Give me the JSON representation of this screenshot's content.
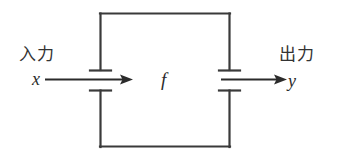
{
  "figure": {
    "kind": "block-diagram",
    "title_text": "",
    "background_color": "#ffffff",
    "stroke_color": "#3a3a3a",
    "width": 338,
    "height": 165
  },
  "block": {
    "name": "system-block",
    "function_label": "f",
    "left": 100,
    "top": 13,
    "right": 230,
    "bottom": 147
  },
  "input": {
    "caption": "入力",
    "variable": "x",
    "arrow_from_x": 45,
    "arrow_to_x": 133,
    "arrow_y": 79
  },
  "output": {
    "caption": "出力",
    "variable": "y",
    "arrow_from_x": 221,
    "arrow_to_x": 287,
    "arrow_y": 79
  },
  "terminals": {
    "bar_half_width": 10,
    "left_upper_bar_y": 70,
    "left_lower_bar_y": 90,
    "right_upper_bar_y": 70,
    "right_lower_bar_y": 90
  }
}
